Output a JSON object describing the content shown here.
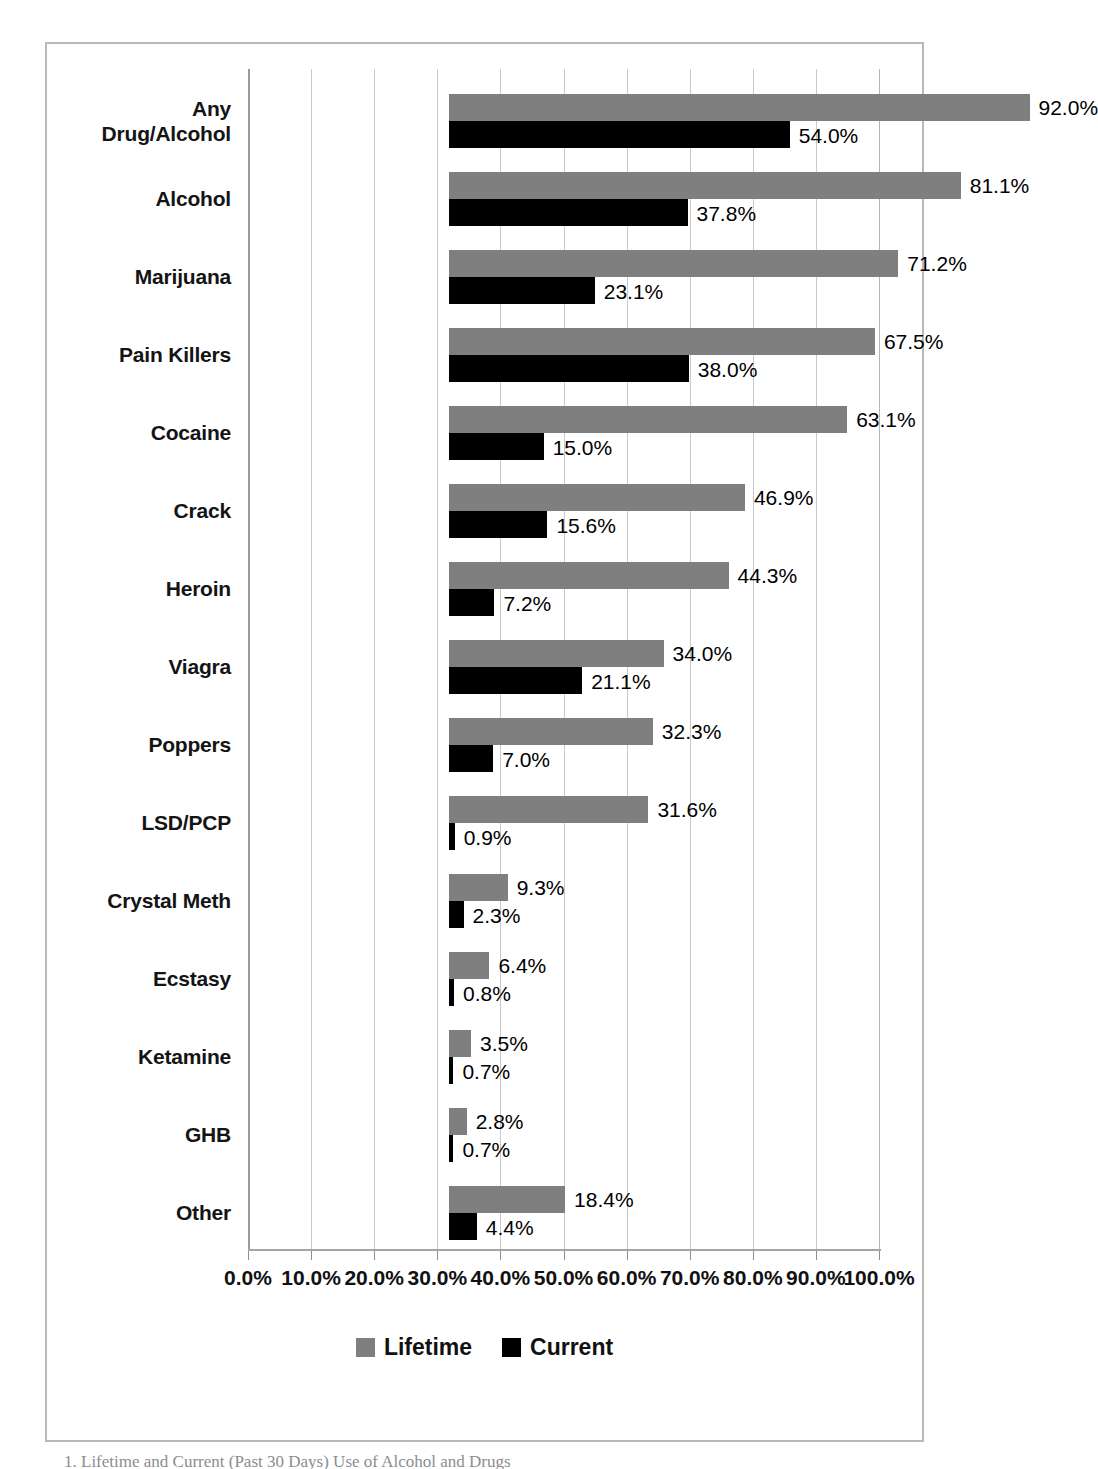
{
  "chart_data": {
    "type": "bar",
    "orientation": "horizontal",
    "title": "",
    "xlabel": "",
    "ylabel": "",
    "xlim": [
      0,
      100
    ],
    "xticks": [
      0,
      10,
      20,
      30,
      40,
      50,
      60,
      70,
      80,
      90,
      100
    ],
    "xtick_labels": [
      "0.0%",
      "10.0%",
      "20.0%",
      "30.0%",
      "40.0%",
      "50.0%",
      "60.0%",
      "70.0%",
      "80.0%",
      "90.0%",
      "100.0%"
    ],
    "grid": true,
    "legend_position": "bottom",
    "categories": [
      "Any Drug/Alcohol",
      "Alcohol",
      "Marijuana",
      "Pain Killers",
      "Cocaine",
      "Crack",
      "Heroin",
      "Viagra",
      "Poppers",
      "LSD/PCP",
      "Crystal Meth",
      "Ecstasy",
      "Ketamine",
      "GHB",
      "Other"
    ],
    "series": [
      {
        "name": "Lifetime",
        "color": "#7f7f7f",
        "values": [
          92.0,
          81.1,
          71.2,
          67.5,
          63.1,
          46.9,
          44.3,
          34.0,
          32.3,
          31.6,
          9.3,
          6.4,
          3.5,
          2.8,
          18.4
        ],
        "labels": [
          "92.0%",
          "81.1%",
          "71.2%",
          "67.5%",
          "63.1%",
          "46.9%",
          "44.3%",
          "34.0%",
          "32.3%",
          "31.6%",
          "9.3%",
          "6.4%",
          "3.5%",
          "2.8%",
          "18.4%"
        ]
      },
      {
        "name": "Current",
        "color": "#000000",
        "values": [
          54.0,
          37.8,
          23.1,
          38.0,
          15.0,
          15.6,
          7.2,
          21.1,
          7.0,
          0.9,
          2.3,
          0.8,
          0.7,
          0.7,
          4.4
        ],
        "labels": [
          "54.0%",
          "37.8%",
          "23.1%",
          "38.0%",
          "15.0%",
          "15.6%",
          "7.2%",
          "21.1%",
          "7.0%",
          "0.9%",
          "2.3%",
          "0.8%",
          "0.7%",
          "0.7%",
          "4.4%"
        ]
      }
    ]
  },
  "legend": {
    "items": [
      {
        "label": "Lifetime",
        "color": "#7f7f7f"
      },
      {
        "label": "Current",
        "color": "#000000"
      }
    ]
  },
  "caption": {
    "text": "1. Lifetime and Current (Past 30 Days) Use of Alcohol and Drugs"
  },
  "category_label_lines": [
    [
      "Any",
      "Drug/Alcohol"
    ],
    [
      "Alcohol"
    ],
    [
      "Marijuana"
    ],
    [
      "Pain Killers"
    ],
    [
      "Cocaine"
    ],
    [
      "Crack"
    ],
    [
      "Heroin"
    ],
    [
      "Viagra"
    ],
    [
      "Poppers"
    ],
    [
      "LSD/PCP"
    ],
    [
      "Crystal Meth"
    ],
    [
      "Ecstasy"
    ],
    [
      "Ketamine"
    ],
    [
      "GHB"
    ],
    [
      "Other"
    ]
  ]
}
